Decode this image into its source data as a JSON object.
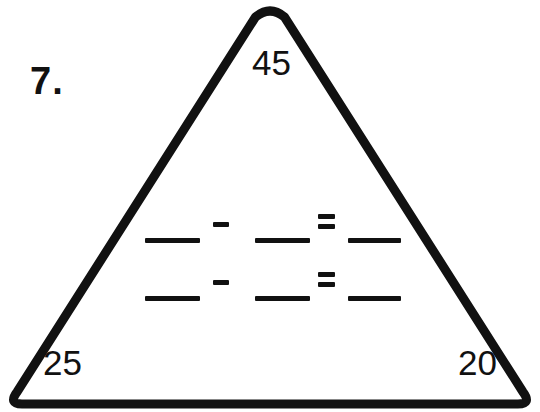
{
  "worksheet": {
    "problem_number": "7.",
    "problem_type": "fact-family-triangle",
    "instruction_text": ""
  },
  "triangle": {
    "stroke_color": "#111111",
    "fill_color": "#ffffff",
    "stroke_width": 9,
    "vertices": {
      "top": {
        "label": "45",
        "position": "top"
      },
      "bottom_left": {
        "label": "25",
        "position": "bottom-left"
      },
      "bottom_right": {
        "label": "20",
        "position": "bottom-right"
      }
    }
  },
  "equations": {
    "rows": [
      {
        "id": "equation-row-1",
        "blank_1_value": "",
        "operator_1": "-",
        "blank_2_value": "",
        "operator_2": "=",
        "blank_3_value": ""
      },
      {
        "id": "equation-row-2",
        "blank_1_value": "",
        "operator_1": "-",
        "blank_2_value": "",
        "operator_2": "=",
        "blank_3_value": ""
      }
    ],
    "operator_minus_glyph": "minus-sign",
    "operator_equals_glyph": "equals-sign"
  },
  "colors": {
    "ink": "#111111",
    "paper": "#ffffff"
  }
}
